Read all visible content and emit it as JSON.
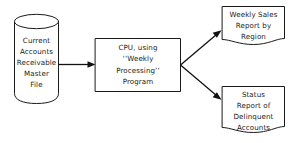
{
  "diagram": {
    "background_color": "#ffffff",
    "line_color": "#1a1a1a",
    "text_color": "#1a1a1a",
    "nodes": {
      "master_file": {
        "shape": "cylinder",
        "semantic": "storage-master-file",
        "lines": [
          "Current",
          "Accounts",
          "Receivable",
          "Master",
          "File"
        ],
        "full_text": "Current Accounts Receivable Master File"
      },
      "cpu_process": {
        "shape": "rectangle",
        "semantic": "process-cpu",
        "lines": [
          "CPU, using",
          "‘‘Weekly",
          "Processing’’",
          "Program"
        ],
        "full_text": "CPU, using ‘‘Weekly Processing’’ Program"
      },
      "report_sales": {
        "shape": "document",
        "semantic": "output-document-weekly-sales",
        "lines": [
          "Weekly Sales",
          "Report by",
          "Region"
        ],
        "full_text": "Weekly Sales Report by Region"
      },
      "report_status": {
        "shape": "document",
        "semantic": "output-document-status",
        "lines": [
          "Status",
          "Report of",
          "Delinquent",
          "Accounts"
        ],
        "full_text": "Status Report of Delinquent Accounts"
      }
    },
    "connectors": [
      {
        "name": "master-file-to-cpu",
        "from": "master_file",
        "to": "cpu_process",
        "direction": "right",
        "arrowhead": true
      },
      {
        "name": "cpu-to-sales-report",
        "from": "cpu_process",
        "to": "report_sales",
        "direction": "up-right",
        "arrowhead": true
      },
      {
        "name": "cpu-to-status-report",
        "from": "cpu_process",
        "to": "report_status",
        "direction": "down-right",
        "arrowhead": true
      }
    ]
  }
}
